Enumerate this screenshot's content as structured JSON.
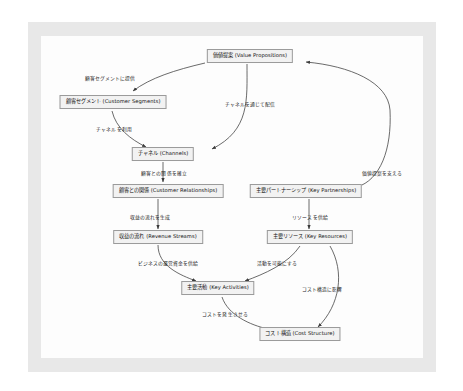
{
  "diagram": {
    "background_color": "#e8e8e8",
    "canvas_color": "#fdfdfd",
    "node_fill": "#f2f2f2",
    "node_border": "#9a9a9a",
    "edge_color": "#3a3a3a",
    "nodes": [
      {
        "id": "value_propositions",
        "label": "価値提案 (Value Propositions)",
        "x": 250,
        "y": 56
      },
      {
        "id": "customer_segments",
        "label": "顧客セグメント (Customer Segments)",
        "x": 113,
        "y": 102
      },
      {
        "id": "channels",
        "label": "チャネル (Channels)",
        "x": 163,
        "y": 154
      },
      {
        "id": "customer_relationships",
        "label": "顧客との関係 (Customer Relationships)",
        "x": 168,
        "y": 191
      },
      {
        "id": "key_partnerships",
        "label": "主要パートナーシップ (Key Partnerships)",
        "x": 306,
        "y": 191
      },
      {
        "id": "revenue_streams",
        "label": "収益の流れ (Revenue Streams)",
        "x": 158,
        "y": 237
      },
      {
        "id": "key_resources",
        "label": "主要リソース (Key Resources)",
        "x": 310,
        "y": 237
      },
      {
        "id": "key_activities",
        "label": "主要活動 (Key Activities)",
        "x": 218,
        "y": 288
      },
      {
        "id": "cost_structure",
        "label": "コスト構造 (Cost Structure)",
        "x": 300,
        "y": 334
      }
    ],
    "edges": [
      {
        "id": "vp-to-cs",
        "from": "value_propositions",
        "to": "customer_segments",
        "label": "顧客セグメントに提供",
        "label_x": 110,
        "label_y": 77
      },
      {
        "id": "vp-to-ch",
        "from": "value_propositions",
        "to": "channels",
        "label": "チャネルを通じて配信",
        "label_x": 250,
        "label_y": 103
      },
      {
        "id": "cs-to-ch",
        "from": "customer_segments",
        "to": "channels",
        "label": "チャネルを利用",
        "label_x": 114,
        "label_y": 128
      },
      {
        "id": "ch-to-cr",
        "from": "channels",
        "to": "customer_relationships",
        "label": "顧客との関係を確立",
        "label_x": 164,
        "label_y": 172
      },
      {
        "id": "cr-to-rs",
        "from": "customer_relationships",
        "to": "revenue_streams",
        "label": "収益の流れを生成",
        "label_x": 150,
        "label_y": 216
      },
      {
        "id": "kp-to-kr",
        "from": "key_partnerships",
        "to": "key_resources",
        "label": "リソースを供給",
        "label_x": 310,
        "label_y": 216
      },
      {
        "id": "rs-to-ka",
        "from": "revenue_streams",
        "to": "key_activities",
        "label": "ビジネスの運営資金を供給",
        "label_x": 168,
        "label_y": 262
      },
      {
        "id": "kr-to-ka",
        "from": "key_resources",
        "to": "key_activities",
        "label": "活動を可能にする",
        "label_x": 277,
        "label_y": 262
      },
      {
        "id": "kr-to-cost",
        "from": "key_resources",
        "to": "cost_structure",
        "label": "コスト構造に影響",
        "label_x": 322,
        "label_y": 288
      },
      {
        "id": "ka-to-cost",
        "from": "key_activities",
        "to": "cost_structure",
        "label": "コストを発生させる",
        "label_x": 225,
        "label_y": 313
      },
      {
        "id": "kp-to-vp",
        "from": "key_partnerships",
        "to": "value_propositions",
        "label": "価値提案を支える",
        "label_x": 382,
        "label_y": 172
      }
    ]
  }
}
